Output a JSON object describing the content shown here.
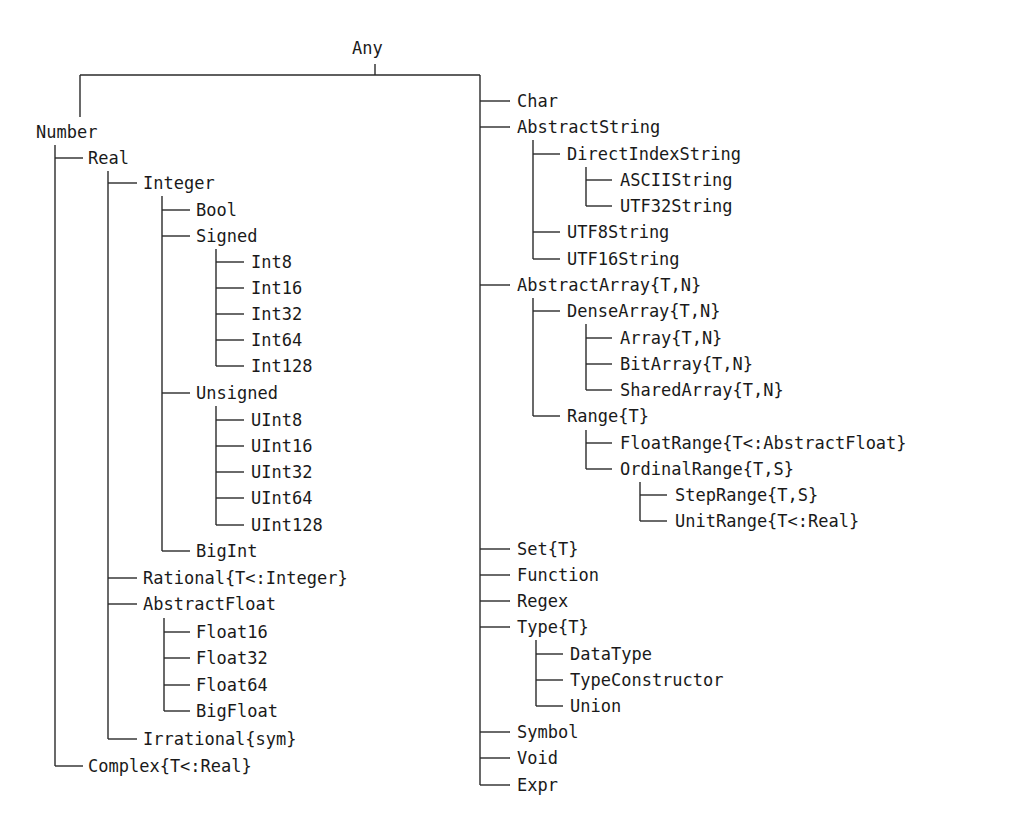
{
  "diagram": {
    "type": "type-hierarchy-tree",
    "root": "Any",
    "nodes": [
      {
        "id": "Any",
        "label": "Any",
        "x": 352,
        "y": 48,
        "parent": null
      },
      {
        "id": "Number",
        "label": "Number",
        "x": 36,
        "y": 132,
        "parent": "Any"
      },
      {
        "id": "Real",
        "label": "Real",
        "x": 88,
        "y": 158,
        "parent": "Number"
      },
      {
        "id": "Integer",
        "label": "Integer",
        "x": 143,
        "y": 183,
        "parent": "Real"
      },
      {
        "id": "Bool",
        "label": "Bool",
        "x": 196,
        "y": 210,
        "parent": "Integer"
      },
      {
        "id": "Signed",
        "label": "Signed",
        "x": 196,
        "y": 236,
        "parent": "Integer"
      },
      {
        "id": "Int8",
        "label": "Int8",
        "x": 251,
        "y": 262,
        "parent": "Signed"
      },
      {
        "id": "Int16",
        "label": "Int16",
        "x": 251,
        "y": 288,
        "parent": "Signed"
      },
      {
        "id": "Int32",
        "label": "Int32",
        "x": 251,
        "y": 314,
        "parent": "Signed"
      },
      {
        "id": "Int64",
        "label": "Int64",
        "x": 251,
        "y": 340,
        "parent": "Signed"
      },
      {
        "id": "Int128",
        "label": "Int128",
        "x": 251,
        "y": 366,
        "parent": "Signed"
      },
      {
        "id": "Unsigned",
        "label": "Unsigned",
        "x": 196,
        "y": 393,
        "parent": "Integer"
      },
      {
        "id": "UInt8",
        "label": "UInt8",
        "x": 251,
        "y": 420,
        "parent": "Unsigned"
      },
      {
        "id": "UInt16",
        "label": "UInt16",
        "x": 251,
        "y": 446,
        "parent": "Unsigned"
      },
      {
        "id": "UInt32",
        "label": "UInt32",
        "x": 251,
        "y": 472,
        "parent": "Unsigned"
      },
      {
        "id": "UInt64",
        "label": "UInt64",
        "x": 251,
        "y": 498,
        "parent": "Unsigned"
      },
      {
        "id": "UInt128",
        "label": "UInt128",
        "x": 251,
        "y": 525,
        "parent": "Unsigned"
      },
      {
        "id": "BigInt",
        "label": "BigInt",
        "x": 196,
        "y": 551,
        "parent": "Integer"
      },
      {
        "id": "Rational",
        "label": "Rational{T<:Integer}",
        "x": 143,
        "y": 578,
        "parent": "Real"
      },
      {
        "id": "AbstractFloat",
        "label": "AbstractFloat",
        "x": 143,
        "y": 604,
        "parent": "Real"
      },
      {
        "id": "Float16",
        "label": "Float16",
        "x": 196,
        "y": 632,
        "parent": "AbstractFloat"
      },
      {
        "id": "Float32",
        "label": "Float32",
        "x": 196,
        "y": 658,
        "parent": "AbstractFloat"
      },
      {
        "id": "Float64",
        "label": "Float64",
        "x": 196,
        "y": 685,
        "parent": "AbstractFloat"
      },
      {
        "id": "BigFloat",
        "label": "BigFloat",
        "x": 196,
        "y": 711,
        "parent": "AbstractFloat"
      },
      {
        "id": "Irrational",
        "label": "Irrational{sym}",
        "x": 143,
        "y": 739,
        "parent": "Real"
      },
      {
        "id": "Complex",
        "label": "Complex{T<:Real}",
        "x": 88,
        "y": 766,
        "parent": "Number"
      },
      {
        "id": "Char",
        "label": "Char",
        "x": 517,
        "y": 101,
        "parent": "Any"
      },
      {
        "id": "AbstractString",
        "label": "AbstractString",
        "x": 517,
        "y": 127,
        "parent": "Any"
      },
      {
        "id": "DirectIndexString",
        "label": "DirectIndexString",
        "x": 567,
        "y": 154,
        "parent": "AbstractString"
      },
      {
        "id": "ASCIIString",
        "label": "ASCIIString",
        "x": 620,
        "y": 180,
        "parent": "DirectIndexString"
      },
      {
        "id": "UTF32String",
        "label": "UTF32String",
        "x": 620,
        "y": 206,
        "parent": "DirectIndexString"
      },
      {
        "id": "UTF8String",
        "label": "UTF8String",
        "x": 567,
        "y": 232,
        "parent": "AbstractString"
      },
      {
        "id": "UTF16String",
        "label": "UTF16String",
        "x": 567,
        "y": 259,
        "parent": "AbstractString"
      },
      {
        "id": "AbstractArray",
        "label": "AbstractArray{T,N}",
        "x": 517,
        "y": 285,
        "parent": "Any"
      },
      {
        "id": "DenseArray",
        "label": "DenseArray{T,N}",
        "x": 567,
        "y": 311,
        "parent": "AbstractArray"
      },
      {
        "id": "Array",
        "label": "Array{T,N}",
        "x": 620,
        "y": 338,
        "parent": "DenseArray"
      },
      {
        "id": "BitArray",
        "label": "BitArray{T,N}",
        "x": 620,
        "y": 364,
        "parent": "DenseArray"
      },
      {
        "id": "SharedArray",
        "label": "SharedArray{T,N}",
        "x": 620,
        "y": 390,
        "parent": "DenseArray"
      },
      {
        "id": "Range",
        "label": "Range{T}",
        "x": 567,
        "y": 416,
        "parent": "AbstractArray"
      },
      {
        "id": "FloatRange",
        "label": "FloatRange{T<:AbstractFloat}",
        "x": 620,
        "y": 443,
        "parent": "Range"
      },
      {
        "id": "OrdinalRange",
        "label": "OrdinalRange{T,S}",
        "x": 620,
        "y": 469,
        "parent": "Range"
      },
      {
        "id": "StepRange",
        "label": "StepRange{T,S}",
        "x": 675,
        "y": 495,
        "parent": "OrdinalRange"
      },
      {
        "id": "UnitRange",
        "label": "UnitRange{T<:Real}",
        "x": 675,
        "y": 521,
        "parent": "OrdinalRange"
      },
      {
        "id": "Set",
        "label": "Set{T}",
        "x": 517,
        "y": 549,
        "parent": "Any"
      },
      {
        "id": "Function",
        "label": "Function",
        "x": 517,
        "y": 575,
        "parent": "Any"
      },
      {
        "id": "Regex",
        "label": "Regex",
        "x": 517,
        "y": 601,
        "parent": "Any"
      },
      {
        "id": "Type",
        "label": "Type{T}",
        "x": 517,
        "y": 627,
        "parent": "Any"
      },
      {
        "id": "DataType",
        "label": "DataType",
        "x": 570,
        "y": 654,
        "parent": "Type"
      },
      {
        "id": "TypeConstructor",
        "label": "TypeConstructor",
        "x": 570,
        "y": 680,
        "parent": "Type"
      },
      {
        "id": "Union",
        "label": "Union",
        "x": 570,
        "y": 706,
        "parent": "Type"
      },
      {
        "id": "Symbol",
        "label": "Symbol",
        "x": 517,
        "y": 732,
        "parent": "Any"
      },
      {
        "id": "Void",
        "label": "Void",
        "x": 517,
        "y": 758,
        "parent": "Any"
      },
      {
        "id": "Expr",
        "label": "Expr",
        "x": 517,
        "y": 785,
        "parent": "Any"
      }
    ],
    "colors": {
      "line": "#2a2a2a",
      "text": "#1a1a1a",
      "background": "#ffffff"
    }
  }
}
